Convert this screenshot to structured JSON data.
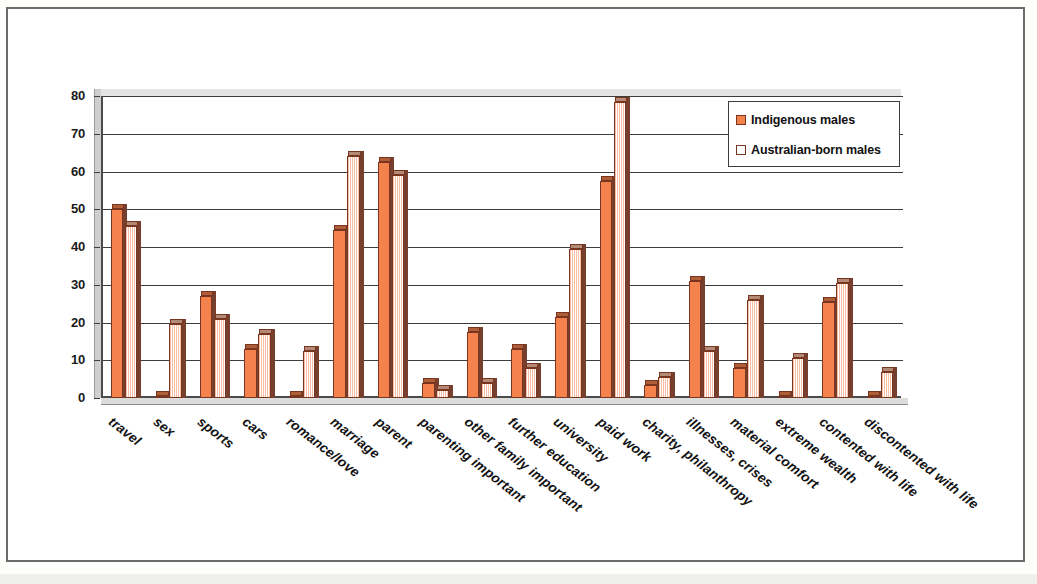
{
  "chart_data": {
    "type": "bar",
    "title": "",
    "xlabel": "",
    "ylabel": "",
    "ylim": [
      0,
      80
    ],
    "ytick_step": 10,
    "yticks": [
      0,
      10,
      20,
      30,
      40,
      50,
      60,
      70,
      80
    ],
    "grid": true,
    "legend_position": "top-right",
    "categories": [
      "travel",
      "sex",
      "sports",
      "cars",
      "romance/love",
      "marriage",
      "parent",
      "parenting important",
      "other family important",
      "further education",
      "university",
      "paid work",
      "charity, philanthropy",
      "illnesses, crises",
      "material comfort",
      "extreme wealth",
      "contented with life",
      "discontented with life"
    ],
    "series": [
      {
        "name": "Indigenous males",
        "color": "#F4824C",
        "values": [
          50,
          0.5,
          27,
          13,
          0.4,
          44.5,
          62.5,
          4,
          17.5,
          13,
          21.5,
          57.5,
          3.5,
          31,
          8,
          0.4,
          25.5,
          0.4
        ]
      },
      {
        "name": "Australian-born males",
        "color": "#F9BFA4",
        "values": [
          45.5,
          19.5,
          21,
          17,
          12.5,
          64,
          59,
          2,
          4,
          8,
          39.5,
          78.5,
          5.5,
          12.5,
          26,
          10.5,
          30.5,
          7
        ]
      }
    ]
  },
  "legend": {
    "items": [
      {
        "label": "Indigenous males",
        "color": "#F4824C"
      },
      {
        "label": "Australian-born males",
        "color": "#FFFFFF"
      }
    ]
  },
  "axis": {
    "y_tick_labels": [
      "80",
      "70",
      "60",
      "50",
      "40",
      "30",
      "20",
      "10",
      "0"
    ]
  },
  "colors": {
    "series_1": "#F4824C",
    "series_2": "#F9BFA4",
    "bar_outline": "#7A3520",
    "bar_side": "#77402E",
    "grid": "#3D3D3D",
    "axis": "#4A4A4A",
    "page_border": "#6B6B6B"
  }
}
